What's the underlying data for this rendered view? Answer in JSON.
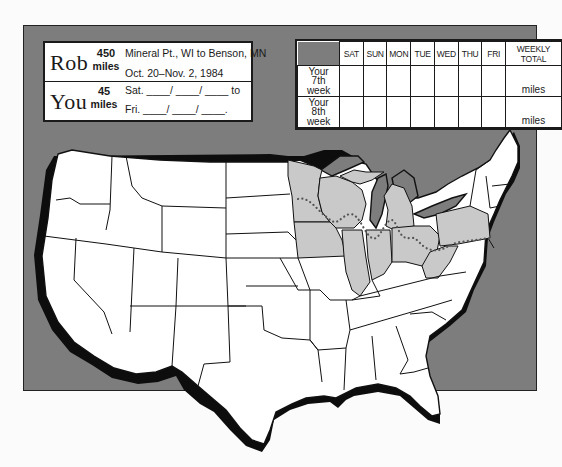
{
  "info": {
    "rows": [
      {
        "name": "Rob",
        "miles": "450",
        "miles_label": "miles",
        "line1": "Mineral Pt., WI to Benson, MN",
        "line2": "Oct. 20–Nov. 2, 1984"
      },
      {
        "name": "You",
        "miles": "45",
        "miles_label": "miles",
        "line1": "Sat. ____/ ____/ ____ to",
        "line2": "Fri. ____/ ____/ ____."
      }
    ]
  },
  "log_table": {
    "headers": [
      "SAT",
      "SUN",
      "MON",
      "TUE",
      "WED",
      "THU",
      "FRI",
      "WEEKLY TOTAL"
    ],
    "rows": [
      {
        "label": [
          "Your",
          "7th",
          "week"
        ],
        "days": [
          "",
          "",
          "",
          "",
          "",
          "",
          ""
        ],
        "total_unit": "miles"
      },
      {
        "label": [
          "Your",
          "8th",
          "week"
        ],
        "days": [
          "",
          "",
          "",
          "",
          "",
          "",
          ""
        ],
        "total_unit": "miles"
      }
    ]
  },
  "map": {
    "title": "United States route map",
    "highlighted_region": "Upper Midwest / Great Lakes states (MN, WI, IA, IL, MI, IN, OH, PA, WV)",
    "route_style": "dotted line",
    "colors": {
      "background_panel": "#7d7d7d",
      "land": "#ffffff",
      "highlight": "#c9c9c9",
      "outline": "#111111"
    }
  }
}
